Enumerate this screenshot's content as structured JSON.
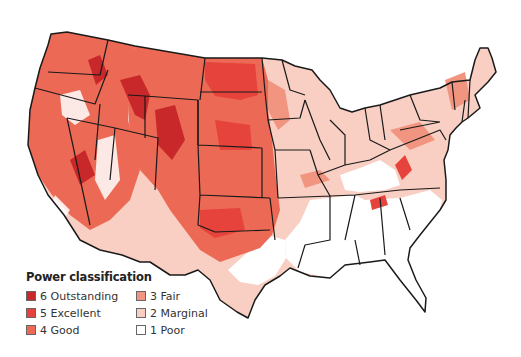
{
  "legend": {
    "title": "Power classification",
    "items": [
      {
        "class": 6,
        "label": "6 Outstanding",
        "color": "#c8282a"
      },
      {
        "class": 5,
        "label": "5 Excellent",
        "color": "#e5433b"
      },
      {
        "class": 4,
        "label": "4 Good",
        "color": "#ec6a55"
      },
      {
        "class": 3,
        "label": "3 Fair",
        "color": "#f29580"
      },
      {
        "class": 2,
        "label": "2 Marginal",
        "color": "#f8cfc2"
      },
      {
        "class": 1,
        "label": "1 Poor",
        "color": "#ffffff"
      }
    ]
  },
  "map": {
    "region": "Contiguous United States",
    "border_color": "#1a1a1a"
  }
}
